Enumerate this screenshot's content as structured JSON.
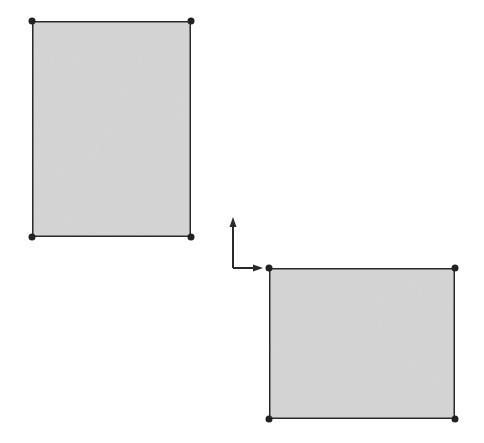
{
  "diagram": {
    "background": "#ffffff",
    "stroke_color": "#2a2a2a",
    "fill_color": "#d6d6d6",
    "vertex_color": "#222222",
    "shapes": [
      {
        "name": "rectangle-upper-left",
        "x": 32,
        "y": 21,
        "width": 159,
        "height": 216
      },
      {
        "name": "rectangle-lower-right",
        "x": 269,
        "y": 268,
        "width": 186,
        "height": 151
      }
    ],
    "origin_axes": {
      "origin": {
        "x": 233,
        "y": 268
      },
      "y_axis_end": {
        "x": 233,
        "y": 218
      },
      "x_axis_end": {
        "x": 262,
        "y": 268
      }
    }
  }
}
